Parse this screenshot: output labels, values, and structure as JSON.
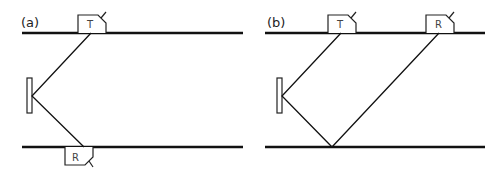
{
  "colors": {
    "line": "#111111",
    "probe_stroke": "#222222",
    "background": "#ffffff"
  },
  "panels": [
    {
      "id": "a",
      "label": "(a)",
      "probes": [
        {
          "label": "T",
          "position": "top"
        },
        {
          "label": "R",
          "position": "bottom"
        }
      ],
      "description": "Transmitter on top surface, beam reflects off defect to receiver on bottom surface"
    },
    {
      "id": "b",
      "label": "(b)",
      "probes": [
        {
          "label": "T",
          "position": "top"
        },
        {
          "label": "R",
          "position": "top"
        }
      ],
      "description": "Transmitter and receiver both on top surface, beam reflects off defect and back wall"
    }
  ]
}
